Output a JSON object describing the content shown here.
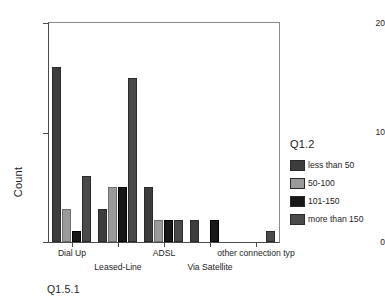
{
  "chart_data": {
    "type": "bar",
    "title": "",
    "xlabel": "",
    "ylabel": "Count",
    "ylim": [
      0,
      20
    ],
    "yticks": [
      0,
      10,
      20
    ],
    "grid": false,
    "legend_position": "right",
    "legend_title": "Q1.2",
    "categories": [
      "Dial Up",
      "Leased-Line",
      "ADSL",
      "Via Satellite",
      "other connection typ"
    ],
    "series": [
      {
        "name": "less than 50",
        "color": "#3d3d3d",
        "values": [
          16,
          3,
          5,
          2,
          0
        ]
      },
      {
        "name": "50-100",
        "color": "#9a9a9a",
        "values": [
          3,
          5,
          2,
          0,
          0
        ]
      },
      {
        "name": "101-150",
        "color": "#171717",
        "values": [
          1,
          5,
          2,
          2,
          0
        ]
      },
      {
        "name": "more than 150",
        "color": "#4a4a4a",
        "values": [
          6,
          15,
          2,
          0,
          1
        ]
      }
    ],
    "annotations": [
      "Q1.5.1"
    ]
  },
  "axis": {
    "y_title": "Count",
    "y_tick_labels": [
      "0",
      "10",
      "20"
    ]
  },
  "legend": {
    "title": "Q1.2",
    "items": [
      {
        "label": "less than 50"
      },
      {
        "label": "50-100"
      },
      {
        "label": "101-150"
      },
      {
        "label": "more than 150"
      }
    ]
  },
  "footer": {
    "label": "Q1.5.1"
  }
}
